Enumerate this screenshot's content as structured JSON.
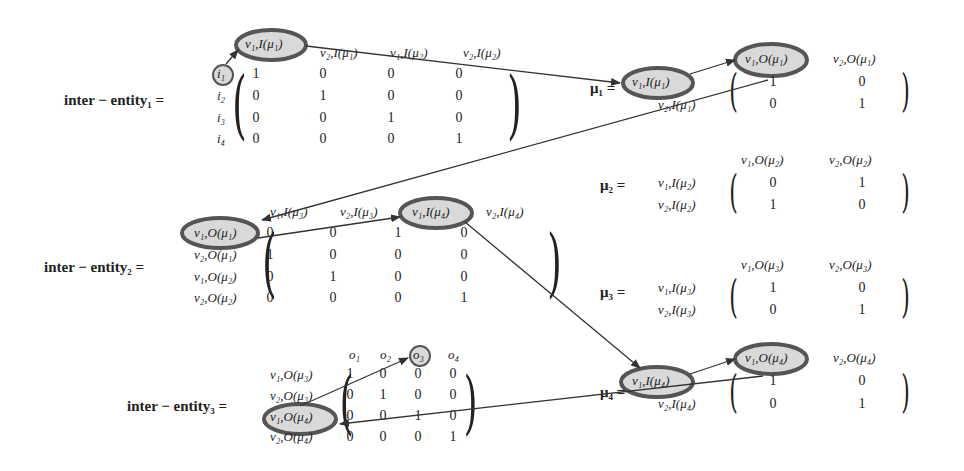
{
  "matrices": {
    "ie1": {
      "label": "inter − entity₁ =",
      "cols": [
        "v₁,I(μ₁)",
        "v₂,I(μ₁)",
        "v₁,I(μ₂)",
        "v₂,I(μ₂)"
      ],
      "rows": [
        "i₁",
        "i₂",
        "i₃",
        "i₄"
      ],
      "values": [
        [
          "1",
          "0",
          "0",
          "0"
        ],
        [
          "0",
          "1",
          "0",
          "0"
        ],
        [
          "0",
          "0",
          "1",
          "0"
        ],
        [
          "0",
          "0",
          "0",
          "1"
        ]
      ]
    },
    "ie2": {
      "label": "inter − entity₂ =",
      "cols": [
        "v₁,I(μ₃)",
        "v₂,I(μ₃)",
        "v₁,I(μ₄)",
        "v₂,I(μ₄)"
      ],
      "rows": [
        "v₁,O(μ₁)",
        "v₂,O(μ₁)",
        "v₁,O(μ₂)",
        "v₂,O(μ₂)"
      ],
      "values": [
        [
          "0",
          "0",
          "1",
          "0"
        ],
        [
          "1",
          "0",
          "0",
          "0"
        ],
        [
          "0",
          "1",
          "0",
          "0"
        ],
        [
          "0",
          "0",
          "0",
          "1"
        ]
      ]
    },
    "ie3": {
      "label": "inter − entity₃ =",
      "cols": [
        "o₁",
        "o₂",
        "o₃",
        "o₄"
      ],
      "rows": [
        "v₁,O(μ₃)",
        "v₂,O(μ₃)",
        "v₁,O(μ₄)",
        "v₂,O(μ₄)"
      ],
      "values": [
        [
          "1",
          "0",
          "0",
          "0"
        ],
        [
          "0",
          "1",
          "0",
          "0"
        ],
        [
          "0",
          "0",
          "1",
          "0"
        ],
        [
          "0",
          "0",
          "0",
          "1"
        ]
      ]
    },
    "mu1": {
      "label": "μ₁ =",
      "cols": [
        "v₁,O(μ₁)",
        "v₂,O(μ₁)"
      ],
      "rows": [
        "v₁,I(μ₁)",
        "v₂,I(μ₁)"
      ],
      "values": [
        [
          "1",
          "0"
        ],
        [
          "0",
          "1"
        ]
      ]
    },
    "mu2": {
      "label": "μ₂ =",
      "cols": [
        "v₁,O(μ₂)",
        "v₂,O(μ₂)"
      ],
      "rows": [
        "v₁,I(μ₂)",
        "v₂,I(μ₂)"
      ],
      "values": [
        [
          "0",
          "1"
        ],
        [
          "1",
          "0"
        ]
      ]
    },
    "mu3": {
      "label": "μ₃ =",
      "cols": [
        "v₁,O(μ₃)",
        "v₂,O(μ₃)"
      ],
      "rows": [
        "v₁,I(μ₃)",
        "v₂,I(μ₃)"
      ],
      "values": [
        [
          "1",
          "0"
        ],
        [
          "0",
          "1"
        ]
      ]
    },
    "mu4": {
      "label": "μ₄ =",
      "cols": [
        "v₁,O(μ₄)",
        "v₂,O(μ₄)"
      ],
      "rows": [
        "v₁,I(μ₄)",
        "v₂,I(μ₄)"
      ],
      "values": [
        [
          "1",
          "0"
        ],
        [
          "0",
          "1"
        ]
      ]
    }
  },
  "highlighted_path": [
    "i₁",
    "v₁,I(μ₁)",
    "v₁,O(μ₁)",
    "v₁,I(μ₄)",
    "v₁,O(μ₄)",
    "o₃"
  ],
  "colors": {
    "highlight_fill": "#d9d9d9",
    "highlight_stroke": "#555555",
    "arrow": "#333333",
    "text": "#222222"
  }
}
